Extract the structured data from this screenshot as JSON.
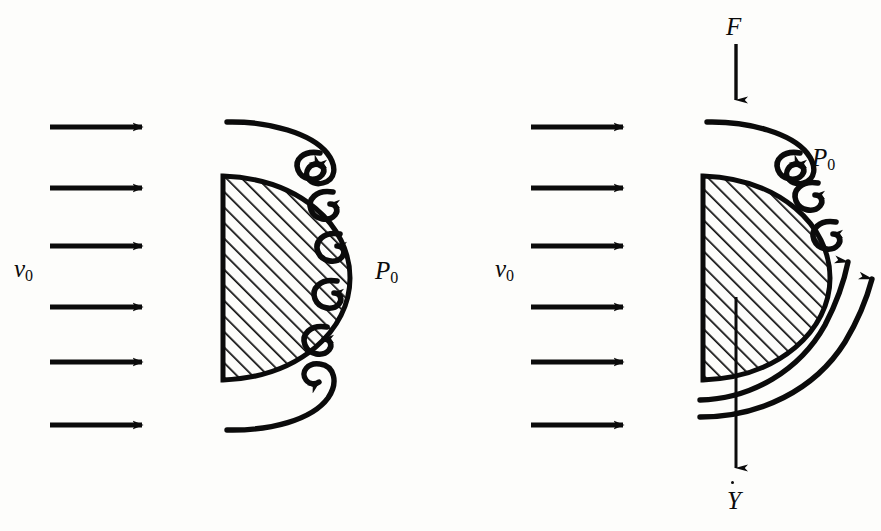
{
  "figure": {
    "background_color": "#fdfdfb",
    "ink_color": "#0b0b0b",
    "width": 881,
    "height": 531
  },
  "panels": [
    {
      "id": "left",
      "name": "stationary-hemisphere",
      "inflow": {
        "label": "v",
        "label_subscript": "0",
        "arrow_count": 6,
        "direction": "right"
      },
      "pressure": {
        "label": "P",
        "label_subscript": "0"
      },
      "body": {
        "shape": "hemisphere",
        "hatched": true,
        "flat_side": "left",
        "curved_side": "right"
      },
      "vortices": {
        "count": 6,
        "description": "separated-wake-vortex-chain"
      },
      "streamlines": {
        "count": 2,
        "description": "top-and-bottom-separating-streamlines-rolling-into-vortices"
      }
    },
    {
      "id": "right",
      "name": "moving-hemisphere",
      "inflow": {
        "label": "v",
        "label_subscript": "0",
        "arrow_count": 6,
        "direction": "right"
      },
      "pressure": {
        "label": "P",
        "label_subscript": "0"
      },
      "force": {
        "label": "F",
        "direction": "down",
        "description": "applied-force-arrow"
      },
      "velocity": {
        "label": "Y",
        "accent": "dot",
        "direction": "down",
        "description": "body-velocity-arrow"
      },
      "body": {
        "shape": "hemisphere",
        "hatched": true,
        "flat_side": "left",
        "curved_side": "right"
      },
      "vortices": {
        "count": 3,
        "description": "reduced-wake-vortex-chain"
      },
      "streamlines": {
        "count": 3,
        "description": "one-top-separating-streamline-and-two-upward-swept-streamlines"
      }
    }
  ],
  "labels": {
    "left_v0_base": "v",
    "left_v0_sub": "0",
    "left_p0_base": "P",
    "left_p0_sub": "0",
    "right_v0_base": "v",
    "right_v0_sub": "0",
    "right_p0_base": "P",
    "right_p0_sub": "0",
    "right_force": "F",
    "right_velocity": "Y"
  }
}
